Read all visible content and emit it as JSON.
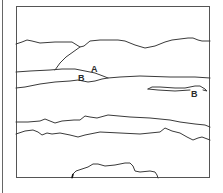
{
  "diagram": {
    "type": "layered cross-section sketch",
    "labels": [
      {
        "id": "label-a",
        "text": "A",
        "x": 95,
        "y": 71
      },
      {
        "id": "label-b-left",
        "text": "B",
        "x": 81,
        "y": 80
      },
      {
        "id": "label-b-right",
        "text": "B",
        "x": 192,
        "y": 97
      }
    ],
    "colors": {
      "line": "#3a3a3a",
      "frame": "#555555",
      "background": "#ffffff"
    }
  }
}
